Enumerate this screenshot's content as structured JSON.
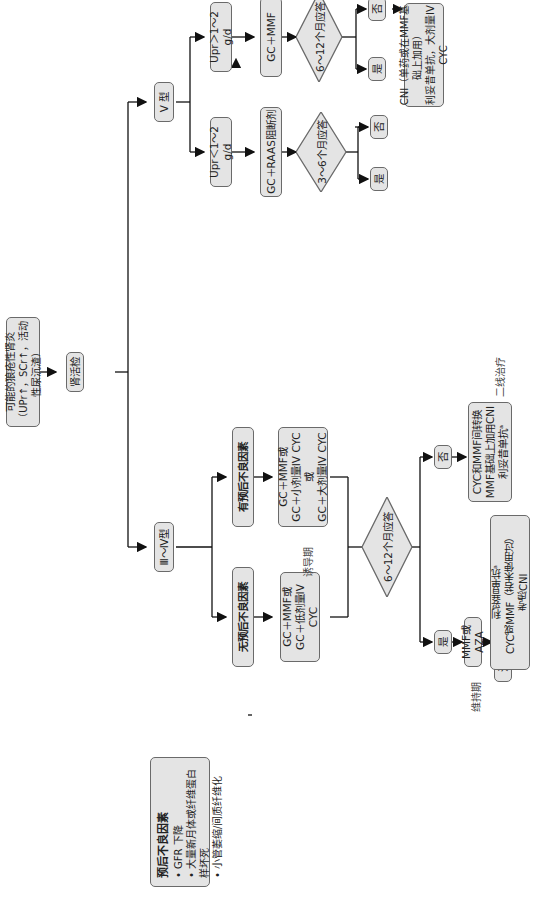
{
  "nodes": {
    "start": {
      "line1": "可能的狼疮性肾炎",
      "line2": "（UPr↑，SCr↑，活动性尿沉渣）"
    },
    "biopsy": "肾活检",
    "class_v": "V 型",
    "class_3_4": "Ⅲ～Ⅳ型",
    "v_low": "Upr＜1～2 g/d",
    "v_high": "Upr＞1～2 g/d",
    "v_low_tx": "GC＋RAAS阻断剂",
    "v_high_tx": "GC＋MMF",
    "v_low_decision": "3～6个月应答",
    "v_high_decision": "6～12个月应答",
    "v_low_yes": "是",
    "v_low_no": "否",
    "v_high_yes": "是",
    "v_high_no": "否",
    "v_high_no_tx": {
      "line1": "CNI（单药或在MMF基础上加用）",
      "line2": "利妥昔单抗，大剂量IV CYC"
    },
    "poor_prog": "有预后不良因素",
    "no_poor_prog": "无预后不良因素",
    "poor_prog_tx": {
      "line1": "GC＋MMF或",
      "line2": "GC＋小剂量IV CYC或",
      "line3": "GC＋大剂量IV CYC"
    },
    "no_poor_prog_tx": {
      "line1": "GC＋MMF或",
      "line2": "GC＋低剂量IV CYC"
    },
    "induction_label": "诱导期",
    "iv_decision": "6～12个月应答",
    "iv_yes": "是",
    "iv_no": "否",
    "iv_no_tx": {
      "line1": "CYC和MMF间转换",
      "line2": "MMF基础上加用CNI",
      "line3": "利妥昔单抗ᵃ"
    },
    "second_line_label": "二线治疗",
    "maintenance_tx": "MMF或AZA",
    "maintenance_label": "维持期",
    "relapse": "治疗期间复发",
    "relapse_tx": {
      "line1": "利妥昔单抗ᵃ",
      "line2": "CYC或MMF（若未使用过）",
      "line3": "考虑CNI"
    },
    "factors": {
      "title": "预后不良因素",
      "items": [
        "GFR 下降",
        "大量新月体或纤维蛋白样坏死",
        "小管萎缩/间质纤维化"
      ]
    }
  },
  "colors": {
    "box_fill": "#e4e4e4",
    "box_border": "#6a6a6a",
    "line": "#111111"
  }
}
